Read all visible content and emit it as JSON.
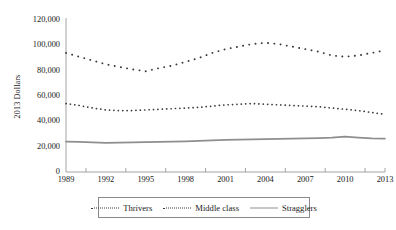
{
  "chart_data": {
    "type": "line",
    "title": "",
    "xlabel": "",
    "ylabel": "2013 Dollars",
    "ylim": [
      0,
      120000
    ],
    "xlim": [
      1989,
      2013
    ],
    "grid": false,
    "legend_position": "bottom",
    "y_ticks": [
      "0",
      "20,000",
      "40,000",
      "60,000",
      "80,000",
      "100,000",
      "120,000"
    ],
    "y_tick_values": [
      0,
      20000,
      40000,
      60000,
      80000,
      100000,
      120000
    ],
    "x_ticks": [
      "1989",
      "1992",
      "1995",
      "1998",
      "2001",
      "2004",
      "2007",
      "2010",
      "2013"
    ],
    "x_tick_values": [
      1989,
      1992,
      1995,
      1998,
      2001,
      2004,
      2007,
      2010,
      2013
    ],
    "x": [
      1989,
      1990,
      1991,
      1992,
      1993,
      1994,
      1995,
      1996,
      1997,
      1998,
      1999,
      2000,
      2001,
      2002,
      2003,
      2004,
      2005,
      2006,
      2007,
      2008,
      2009,
      2010,
      2011,
      2012,
      2013
    ],
    "series": [
      {
        "name": "Thrivers",
        "style": "dotted-sparse",
        "color": "#3a3a3a",
        "values": [
          94000,
          91000,
          88000,
          85000,
          83000,
          81000,
          79500,
          82000,
          84000,
          87000,
          90000,
          94000,
          97000,
          99000,
          101000,
          102000,
          101000,
          99000,
          97000,
          95000,
          92000,
          91000,
          92000,
          94000,
          96000
        ]
      },
      {
        "name": "Middle class",
        "style": "dotted-dense",
        "color": "#3a3a3a",
        "values": [
          54000,
          52500,
          50500,
          49000,
          48500,
          48500,
          49000,
          49500,
          50000,
          50500,
          51000,
          52000,
          53000,
          53500,
          54000,
          53500,
          53000,
          52500,
          52000,
          51500,
          50500,
          49500,
          48500,
          47000,
          45500
        ]
      },
      {
        "name": "Stragglers",
        "style": "solid",
        "color": "#8e8e8e",
        "values": [
          24000,
          23800,
          23400,
          23000,
          23200,
          23400,
          23600,
          23800,
          24000,
          24200,
          24600,
          25000,
          25400,
          25600,
          25800,
          26000,
          26200,
          26400,
          26600,
          26800,
          27200,
          28000,
          27200,
          26600,
          26400
        ]
      }
    ]
  },
  "legend": {
    "items": [
      {
        "label": "Thrivers",
        "swatch": "dotted-sparse"
      },
      {
        "label": "Middle class",
        "swatch": "dotted-dense"
      },
      {
        "label": "Stragglers",
        "swatch": "solid"
      }
    ]
  }
}
